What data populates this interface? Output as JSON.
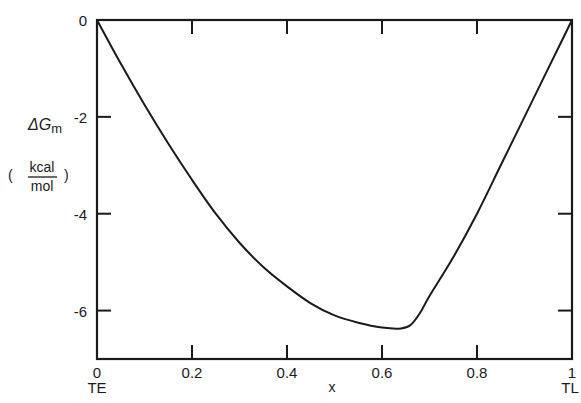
{
  "chart_data": {
    "type": "line",
    "title": "",
    "xlabel": "x",
    "ylabel": "ΔGm",
    "ylabel_units": {
      "numerator": "kcal",
      "denominator": "mol"
    },
    "xlim": [
      0,
      1
    ],
    "ylim": [
      -7,
      0
    ],
    "grid": false,
    "legend": null,
    "x_ticks": [
      {
        "value": 0,
        "label": "0",
        "sublabel": "TE"
      },
      {
        "value": 0.2,
        "label": "0.2"
      },
      {
        "value": 0.4,
        "label": "0.4"
      },
      {
        "value": 0.6,
        "label": "0.6"
      },
      {
        "value": 0.8,
        "label": "0.8"
      },
      {
        "value": 1,
        "label": "1",
        "sublabel": "TL"
      }
    ],
    "y_ticks": [
      {
        "value": 0,
        "label": "0"
      },
      {
        "value": -2,
        "label": "-2"
      },
      {
        "value": -4,
        "label": "-4"
      },
      {
        "value": -6,
        "label": "-6"
      }
    ],
    "series": [
      {
        "name": "ΔGm",
        "x": [
          0,
          0.05,
          0.1,
          0.15,
          0.2,
          0.25,
          0.3,
          0.35,
          0.4,
          0.45,
          0.5,
          0.55,
          0.6,
          0.64,
          0.66,
          0.68,
          0.7,
          0.75,
          0.8,
          0.85,
          0.9,
          0.95,
          1.0
        ],
        "values": [
          0,
          -0.9,
          -1.75,
          -2.55,
          -3.3,
          -4.0,
          -4.6,
          -5.1,
          -5.5,
          -5.85,
          -6.1,
          -6.25,
          -6.35,
          -6.37,
          -6.3,
          -6.05,
          -5.7,
          -4.9,
          -4.0,
          -3.0,
          -2.0,
          -1.0,
          0
        ]
      }
    ]
  },
  "labels": {
    "y_axis": "ΔGm",
    "y_units_num": "kcal",
    "y_units_den": "mol",
    "x_axis": "x",
    "x_left_sublabel": "TE",
    "x_right_sublabel": "TL"
  }
}
